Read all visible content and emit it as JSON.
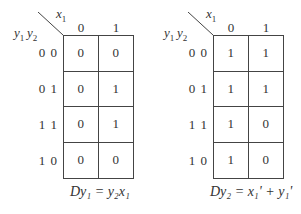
{
  "kmaps": [
    {
      "x_var": "x",
      "x_sub": "1",
      "y_vars": [
        {
          "v": "y",
          "s": "1"
        },
        {
          "v": "y",
          "s": "2"
        }
      ],
      "columns": [
        "0",
        "1"
      ],
      "rows": [
        "0 0",
        "0 1",
        "1 1",
        "1 0"
      ],
      "cells": [
        [
          "0",
          "0"
        ],
        [
          "0",
          "1"
        ],
        [
          "0",
          "1"
        ],
        [
          "0",
          "0"
        ]
      ],
      "equation": "Dy₁ = y₂x₁"
    },
    {
      "x_var": "x",
      "x_sub": "1",
      "y_vars": [
        {
          "v": "y",
          "s": "1"
        },
        {
          "v": "y",
          "s": "2"
        }
      ],
      "columns": [
        "0",
        "1"
      ],
      "rows": [
        "0 0",
        "0 1",
        "1 1",
        "1 0"
      ],
      "cells": [
        [
          "1",
          "1"
        ],
        [
          "1",
          "1"
        ],
        [
          "1",
          "0"
        ],
        [
          "1",
          "0"
        ]
      ],
      "equation": "Dy₂ = x₁' + y₁'"
    }
  ]
}
